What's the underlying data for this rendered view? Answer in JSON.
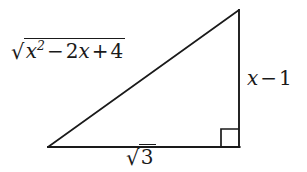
{
  "figure": {
    "background_color": "#ffffff",
    "stroke_color": "#1a1a1a",
    "labels": {
      "hypotenuse": {
        "text": "√(x² − 2x + 4)",
        "radicand_var": "x",
        "radicand_exponent": "2",
        "radicand_op1": "−",
        "radicand_term2_coeff": "2",
        "radicand_term2_var": "x",
        "radicand_op2": "+",
        "radicand_term3": "4",
        "radical_sign": "√"
      },
      "vertical_leg": {
        "text": "x − 1",
        "var": "x",
        "op": "−",
        "constant": "1"
      },
      "base": {
        "text": "√3",
        "radical_sign": "√",
        "radicand": "3"
      }
    },
    "geometry": {
      "left_vertex": "48,147",
      "bottom_right_vertex": "239,147",
      "apex_vertex": "239,10",
      "right_angle_marker": "bottom-right",
      "right_angle_size": "18"
    }
  }
}
